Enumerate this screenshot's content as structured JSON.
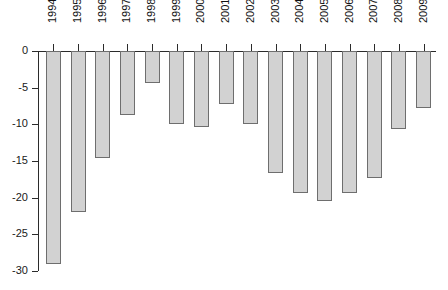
{
  "chart_data": {
    "type": "bar",
    "title": "",
    "subtitle": "",
    "xlabel": "",
    "ylabel": "",
    "categories": [
      "1994",
      "1995",
      "1996",
      "1997",
      "1998",
      "1999",
      "2000",
      "2001",
      "2002",
      "2003",
      "2004",
      "2005",
      "2006",
      "2007",
      "2008",
      "2009"
    ],
    "values": [
      -29.0,
      -22.0,
      -14.6,
      -8.7,
      -4.4,
      -10.0,
      -10.3,
      -7.2,
      -9.9,
      -16.6,
      -19.4,
      -20.5,
      -19.3,
      -17.3,
      -10.6,
      -7.8
    ],
    "ylim": [
      -30,
      0
    ],
    "ytick_labels": [
      "0",
      "-5",
      "-10",
      "-15",
      "-20",
      "-25",
      "-30"
    ],
    "ytick_values": [
      0,
      -5,
      -10,
      -15,
      -20,
      -25,
      -30
    ],
    "grid": false,
    "legend": null,
    "legend_position": "none",
    "bar_fill_color": "#d2d2d2",
    "bar_border_color": "#6e6e6e",
    "axis_color": "#2b2b2b",
    "background_color": "#ffffff",
    "orientation": "vertical",
    "baseline": 0,
    "x_axis_position": "top",
    "x_label_rotation": 90
  }
}
